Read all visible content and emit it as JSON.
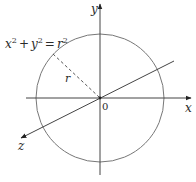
{
  "diagram": {
    "equation": {
      "x": "x",
      "y": "y",
      "r": "r",
      "exp": "2",
      "plus": "+",
      "eq": "="
    },
    "labels": {
      "x_axis": "x",
      "y_axis": "y",
      "z_axis": "z",
      "origin": "0",
      "radius": "r"
    },
    "geometry": {
      "center": [
        99,
        98
      ],
      "radius": 64,
      "radius_endpoint": [
        53,
        54
      ]
    },
    "colors": {
      "stroke": "#444444",
      "circle": "#777777",
      "text": "#2a2a2a"
    }
  }
}
